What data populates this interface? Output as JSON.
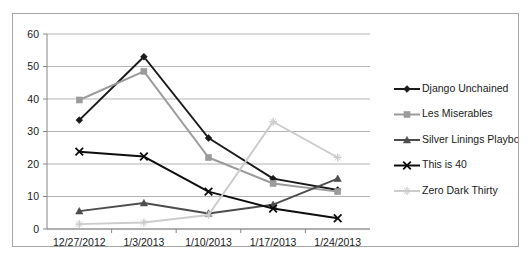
{
  "chart_data": {
    "type": "line",
    "title": "",
    "subtitle": "",
    "xlabel": "",
    "ylabel": "",
    "categories": [
      "12/27/2012",
      "1/3/2013",
      "1/10/2013",
      "1/17/2013",
      "1/24/2013"
    ],
    "ylim": [
      0,
      60
    ],
    "yticks": [
      0,
      10,
      20,
      30,
      40,
      50,
      60
    ],
    "ytick_labels": [
      "0",
      "10",
      "20",
      "30",
      "40",
      "50",
      "60"
    ],
    "grid": "horizontal",
    "legend_position": "right",
    "series": [
      {
        "name": "Django Unchained",
        "values": [
          33.5,
          53.0,
          28.0,
          15.5,
          12.0
        ],
        "color": "#1a1a1a",
        "marker": "diamond"
      },
      {
        "name": "Les Miserables",
        "values": [
          39.7,
          48.5,
          22.0,
          14.0,
          11.5
        ],
        "color": "#9b9b9b",
        "marker": "square"
      },
      {
        "name": "Silver Linings Playbook",
        "values": [
          5.5,
          8.0,
          4.8,
          7.5,
          15.5
        ],
        "color": "#4d4d4d",
        "marker": "triangle"
      },
      {
        "name": "This is 40",
        "values": [
          23.8,
          22.3,
          11.5,
          6.3,
          3.3
        ],
        "color": "#0d0d0d",
        "marker": "cross"
      },
      {
        "name": "Zero Dark Thirty",
        "values": [
          1.5,
          2.0,
          4.3,
          33.0,
          22.0
        ],
        "color": "#cccccc",
        "marker": "star"
      }
    ]
  },
  "axes": {
    "y_tick_labels": [
      "60",
      "50",
      "40",
      "30",
      "20",
      "10",
      "0"
    ],
    "x_tick_labels": [
      "12/27/2012",
      "1/3/2013",
      "1/10/2013",
      "1/17/2013",
      "1/24/2013"
    ]
  },
  "legend": {
    "items": [
      {
        "label": "Django Unchained"
      },
      {
        "label": "Les Miserables"
      },
      {
        "label": "Silver Linings Playbook"
      },
      {
        "label": "This is 40"
      },
      {
        "label": "Zero Dark Thirty"
      }
    ]
  }
}
